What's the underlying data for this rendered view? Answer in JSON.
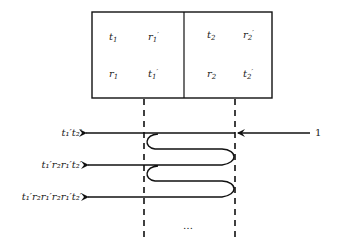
{
  "diagram": {
    "box": {
      "left_cell": {
        "top_left": {
          "base": "t",
          "sub": "1",
          "prime": ""
        },
        "top_right": {
          "base": "r",
          "sub": "1",
          "prime": "′"
        },
        "bottom_left": {
          "base": "r",
          "sub": "1",
          "prime": ""
        },
        "bottom_right": {
          "base": "t",
          "sub": "1",
          "prime": "′"
        }
      },
      "right_cell": {
        "top_left": {
          "base": "t",
          "sub": "2",
          "prime": ""
        },
        "top_right": {
          "base": "r",
          "sub": "2",
          "prime": "′"
        },
        "bottom_left": {
          "base": "r",
          "sub": "2",
          "prime": ""
        },
        "bottom_right": {
          "base": "t",
          "sub": "2",
          "prime": "′"
        }
      }
    },
    "input_label": "1",
    "output_labels": [
      "t₁′t₂′",
      "t₁′r₂r₁′t₂′",
      "t₁′r₂r₁′r₂r₁′t₂′"
    ],
    "ellipsis": "…",
    "colors": {
      "stroke": "#111111",
      "text": "#222222",
      "background": "#ffffff"
    }
  }
}
